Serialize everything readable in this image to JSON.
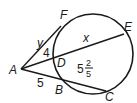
{
  "diagram": {
    "type": "circle-secant-tangent",
    "points": {
      "A": {
        "label": "A"
      },
      "F": {
        "label": "F"
      },
      "E": {
        "label": "E"
      },
      "D": {
        "label": "D"
      },
      "B": {
        "label": "B"
      },
      "C": {
        "label": "C"
      }
    },
    "segment_labels": {
      "AF": "y",
      "AD": "4",
      "DE": "x",
      "AB": "5",
      "BC_whole": "5",
      "BC_num": "2",
      "BC_den": "5"
    },
    "stroke_color": "#1a1a1a"
  }
}
